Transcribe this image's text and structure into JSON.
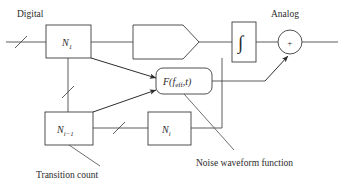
{
  "diagram": {
    "title_labels": {
      "digital": "Digital",
      "analog": "Analog"
    },
    "blocks": [
      {
        "id": "n1",
        "name": "counter-n1",
        "shape": "rectangle",
        "base": "N",
        "subscript": "1",
        "label": "N1"
      },
      {
        "id": "dac",
        "name": "dac-block",
        "shape": "pentagon",
        "label": ""
      },
      {
        "id": "integrator",
        "name": "integrator-block",
        "shape": "rectangle",
        "label": "∫"
      },
      {
        "id": "summer",
        "name": "summing-junction",
        "shape": "circle",
        "label": "+"
      },
      {
        "id": "noise",
        "name": "noise-waveform-block",
        "shape": "rounded-rectangle",
        "base": "F",
        "arg_base": "f",
        "arg_sub": "eff",
        "arg_var": "t",
        "label": "F(f_eff,t)"
      },
      {
        "id": "nim1",
        "name": "counter-n-i-minus-1",
        "shape": "rectangle",
        "base": "N",
        "subscript": "i−1",
        "label": "N i-1"
      },
      {
        "id": "ni",
        "name": "counter-n-i",
        "shape": "rectangle",
        "base": "N",
        "subscript": "i",
        "label": "N i"
      }
    ],
    "annotations": [
      {
        "id": "transition-count",
        "text": "Transition count"
      },
      {
        "id": "noise-waveform-function",
        "text": "Noise waveform function"
      }
    ],
    "colors": {
      "line": "#4a4a4a",
      "text": "#2b2b2b",
      "background": "#ffffff"
    }
  }
}
